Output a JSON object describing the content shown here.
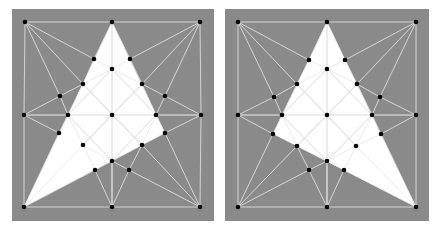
{
  "figure": {
    "width": 436,
    "height": 229,
    "background": "#ffffff",
    "box_fill": "#8a8a8a",
    "mesh_line_color": "#e6e6e6",
    "inner_line_color": "#dcdcdc",
    "triangle_fill": "#ffffff",
    "point_color": "#000000",
    "point_radius": 2.3
  },
  "panels": [
    {
      "id": "left",
      "box": {
        "x": 12,
        "y": 9,
        "w": 202,
        "h": 212
      },
      "triangle": [
        [
          112,
          22
        ],
        [
          165,
          133
        ],
        [
          24,
          207
        ]
      ],
      "points": [
        [
          25,
          22
        ],
        [
          112,
          22
        ],
        [
          200,
          22
        ],
        [
          24,
          115
        ],
        [
          112,
          115
        ],
        [
          201,
          115
        ],
        [
          24,
          207
        ],
        [
          112,
          207
        ],
        [
          200,
          207
        ],
        [
          94,
          59
        ],
        [
          130,
          59
        ],
        [
          112,
          69
        ],
        [
          83,
          84
        ],
        [
          142,
          84
        ],
        [
          60,
          96
        ],
        [
          165,
          96
        ],
        [
          68,
          115
        ],
        [
          156,
          115
        ],
        [
          59,
          133
        ],
        [
          165,
          133
        ],
        [
          83,
          145
        ],
        [
          142,
          145
        ],
        [
          112,
          161
        ],
        [
          95,
          170
        ],
        [
          129,
          170
        ]
      ],
      "edges": [
        [
          0,
          1
        ],
        [
          1,
          2
        ],
        [
          0,
          3
        ],
        [
          3,
          6
        ],
        [
          6,
          7
        ],
        [
          7,
          8
        ],
        [
          2,
          5
        ],
        [
          5,
          8
        ],
        [
          0,
          9
        ],
        [
          0,
          12
        ],
        [
          0,
          14
        ],
        [
          2,
          10
        ],
        [
          2,
          13
        ],
        [
          2,
          15
        ],
        [
          3,
          14
        ],
        [
          3,
          16
        ],
        [
          3,
          18
        ],
        [
          5,
          15
        ],
        [
          5,
          17
        ],
        [
          5,
          19
        ],
        [
          6,
          18
        ],
        [
          6,
          20
        ],
        [
          6,
          23
        ],
        [
          8,
          19
        ],
        [
          8,
          21
        ],
        [
          8,
          24
        ],
        [
          7,
          23
        ],
        [
          7,
          22
        ],
        [
          7,
          24
        ],
        [
          14,
          12
        ],
        [
          14,
          16
        ],
        [
          12,
          9
        ],
        [
          10,
          13
        ],
        [
          13,
          15
        ],
        [
          15,
          17
        ],
        [
          16,
          18
        ],
        [
          17,
          19
        ],
        [
          19,
          21
        ],
        [
          21,
          24
        ],
        [
          20,
          23
        ],
        [
          24,
          22
        ],
        [
          22,
          23
        ],
        [
          1,
          9
        ],
        [
          1,
          10
        ],
        [
          9,
          11
        ],
        [
          10,
          11
        ],
        [
          1,
          4
        ],
        [
          4,
          7
        ],
        [
          11,
          12
        ],
        [
          11,
          13
        ],
        [
          12,
          16
        ],
        [
          13,
          17
        ],
        [
          16,
          4
        ],
        [
          4,
          17
        ],
        [
          16,
          20
        ],
        [
          17,
          21
        ],
        [
          20,
          22
        ],
        [
          21,
          22
        ],
        [
          12,
          4
        ],
        [
          13,
          4
        ],
        [
          20,
          4
        ],
        [
          21,
          4
        ]
      ],
      "inner_edges": [
        [
          1,
          4
        ],
        [
          4,
          22
        ],
        [
          3,
          5
        ],
        [
          12,
          21
        ],
        [
          13,
          20
        ],
        [
          11,
          16
        ],
        [
          11,
          17
        ],
        [
          16,
          22
        ],
        [
          17,
          22
        ]
      ]
    },
    {
      "id": "right",
      "box": {
        "x": 225,
        "y": 9,
        "w": 204,
        "h": 212
      },
      "triangle": [
        [
          327,
          22
        ],
        [
          416,
          207
        ],
        [
          273,
          134
        ]
      ],
      "points": [
        [
          238,
          22
        ],
        [
          327,
          22
        ],
        [
          416,
          22
        ],
        [
          238,
          115
        ],
        [
          327,
          115
        ],
        [
          416,
          115
        ],
        [
          238,
          207
        ],
        [
          327,
          207
        ],
        [
          416,
          207
        ],
        [
          309,
          60
        ],
        [
          345,
          60
        ],
        [
          327,
          69
        ],
        [
          297,
          84
        ],
        [
          357,
          84
        ],
        [
          274,
          97
        ],
        [
          380,
          97
        ],
        [
          282,
          115
        ],
        [
          372,
          115
        ],
        [
          273,
          134
        ],
        [
          381,
          134
        ],
        [
          297,
          146
        ],
        [
          356,
          146
        ],
        [
          327,
          161
        ],
        [
          309,
          170
        ],
        [
          344,
          170
        ]
      ],
      "edges": [
        [
          0,
          1
        ],
        [
          1,
          2
        ],
        [
          0,
          3
        ],
        [
          3,
          6
        ],
        [
          6,
          7
        ],
        [
          7,
          8
        ],
        [
          2,
          5
        ],
        [
          5,
          8
        ],
        [
          0,
          9
        ],
        [
          0,
          12
        ],
        [
          0,
          14
        ],
        [
          2,
          10
        ],
        [
          2,
          13
        ],
        [
          2,
          15
        ],
        [
          3,
          14
        ],
        [
          3,
          16
        ],
        [
          3,
          18
        ],
        [
          5,
          15
        ],
        [
          5,
          17
        ],
        [
          5,
          19
        ],
        [
          6,
          18
        ],
        [
          6,
          20
        ],
        [
          6,
          23
        ],
        [
          8,
          19
        ],
        [
          8,
          21
        ],
        [
          8,
          24
        ],
        [
          7,
          23
        ],
        [
          7,
          22
        ],
        [
          7,
          24
        ],
        [
          14,
          12
        ],
        [
          14,
          16
        ],
        [
          12,
          9
        ],
        [
          10,
          13
        ],
        [
          13,
          15
        ],
        [
          15,
          17
        ],
        [
          16,
          18
        ],
        [
          17,
          19
        ],
        [
          19,
          21
        ],
        [
          21,
          24
        ],
        [
          20,
          23
        ],
        [
          24,
          22
        ],
        [
          22,
          23
        ],
        [
          1,
          9
        ],
        [
          1,
          10
        ],
        [
          9,
          11
        ],
        [
          10,
          11
        ],
        [
          1,
          4
        ],
        [
          4,
          7
        ],
        [
          11,
          12
        ],
        [
          11,
          13
        ],
        [
          12,
          16
        ],
        [
          13,
          17
        ],
        [
          16,
          4
        ],
        [
          4,
          17
        ],
        [
          16,
          20
        ],
        [
          17,
          21
        ],
        [
          20,
          22
        ],
        [
          21,
          22
        ],
        [
          12,
          4
        ],
        [
          13,
          4
        ],
        [
          20,
          4
        ],
        [
          21,
          4
        ]
      ],
      "inner_edges": [
        [
          1,
          4
        ],
        [
          4,
          22
        ],
        [
          3,
          5
        ],
        [
          12,
          21
        ],
        [
          13,
          20
        ],
        [
          11,
          16
        ],
        [
          11,
          17
        ],
        [
          16,
          22
        ],
        [
          17,
          22
        ]
      ]
    }
  ]
}
